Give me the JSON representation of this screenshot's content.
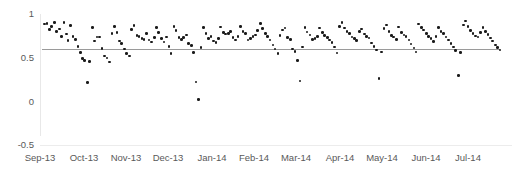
{
  "chart_data": {
    "type": "scatter",
    "title": "",
    "xlabel": "",
    "ylabel": "",
    "ylim": [
      -0.5,
      1
    ],
    "xlim": [
      "Sep-13",
      "Aug-14"
    ],
    "grid": false,
    "legend": null,
    "y_ticks": [
      "1",
      "0.5",
      "0",
      "-0.5"
    ],
    "y_tick_values": [
      1,
      0.5,
      0,
      -0.5
    ],
    "x_ticks": [
      "Sep-13",
      "Oct-13",
      "Nov-13",
      "Dec-13",
      "Jan-14",
      "Feb-14",
      "Mar-14",
      "Apr-14",
      "May-14",
      "Jun-14",
      "Jul-14"
    ],
    "reference_line": {
      "y": 0.6,
      "color": "#9a9a9a",
      "label": ""
    },
    "marker_color": "#1a1a1a",
    "series": [
      {
        "name": "series-1",
        "points": [
          [
            0.005,
            0.885
          ],
          [
            0.011,
            0.888
          ],
          [
            0.016,
            0.824
          ],
          [
            0.021,
            0.86
          ],
          [
            0.027,
            0.905
          ],
          [
            0.032,
            0.798
          ],
          [
            0.038,
            0.83
          ],
          [
            0.043,
            0.742
          ],
          [
            0.048,
            0.9
          ],
          [
            0.054,
            0.77
          ],
          [
            0.057,
            0.695
          ],
          [
            0.062,
            0.865
          ],
          [
            0.068,
            0.74
          ],
          [
            0.073,
            0.708
          ],
          [
            0.079,
            0.63
          ],
          [
            0.084,
            0.56
          ],
          [
            0.088,
            0.49
          ],
          [
            0.093,
            0.47
          ],
          [
            0.099,
            0.215
          ],
          [
            0.104,
            0.455
          ],
          [
            0.11,
            0.845
          ],
          [
            0.115,
            0.69
          ],
          [
            0.12,
            0.735
          ],
          [
            0.126,
            0.735
          ],
          [
            0.131,
            0.605
          ],
          [
            0.137,
            0.52
          ],
          [
            0.142,
            0.495
          ],
          [
            0.147,
            0.45
          ],
          [
            0.153,
            0.78
          ],
          [
            0.158,
            0.855
          ],
          [
            0.164,
            0.79
          ],
          [
            0.169,
            0.69
          ],
          [
            0.174,
            0.66
          ],
          [
            0.18,
            0.6
          ],
          [
            0.185,
            0.545
          ],
          [
            0.191,
            0.52
          ],
          [
            0.196,
            0.82
          ],
          [
            0.201,
            0.865
          ],
          [
            0.207,
            0.755
          ],
          [
            0.212,
            0.74
          ],
          [
            0.218,
            0.72
          ],
          [
            0.223,
            0.705
          ],
          [
            0.228,
            0.775
          ],
          [
            0.234,
            0.7
          ],
          [
            0.239,
            0.68
          ],
          [
            0.245,
            0.73
          ],
          [
            0.25,
            0.845
          ],
          [
            0.255,
            0.79
          ],
          [
            0.261,
            0.72
          ],
          [
            0.266,
            0.68
          ],
          [
            0.272,
            0.735
          ],
          [
            0.277,
            0.63
          ],
          [
            0.282,
            0.545
          ],
          [
            0.288,
            0.86
          ],
          [
            0.293,
            0.81
          ],
          [
            0.299,
            0.73
          ],
          [
            0.304,
            0.705
          ],
          [
            0.309,
            0.73
          ],
          [
            0.315,
            0.76
          ],
          [
            0.32,
            0.665
          ],
          [
            0.326,
            0.64
          ],
          [
            0.331,
            0.56
          ],
          [
            0.336,
            0.22
          ],
          [
            0.342,
            0.02
          ],
          [
            0.347,
            0.615
          ],
          [
            0.353,
            0.845
          ],
          [
            0.358,
            0.78
          ],
          [
            0.363,
            0.72
          ],
          [
            0.369,
            0.74
          ],
          [
            0.374,
            0.69
          ],
          [
            0.38,
            0.675
          ],
          [
            0.385,
            0.72
          ],
          [
            0.39,
            0.85
          ],
          [
            0.396,
            0.79
          ],
          [
            0.401,
            0.77
          ],
          [
            0.407,
            0.78
          ],
          [
            0.412,
            0.8
          ],
          [
            0.417,
            0.73
          ],
          [
            0.423,
            0.7
          ],
          [
            0.428,
            0.745
          ],
          [
            0.434,
            0.855
          ],
          [
            0.439,
            0.8
          ],
          [
            0.444,
            0.775
          ],
          [
            0.45,
            0.7
          ],
          [
            0.455,
            0.72
          ],
          [
            0.461,
            0.745
          ],
          [
            0.466,
            0.76
          ],
          [
            0.471,
            0.81
          ],
          [
            0.477,
            0.89
          ],
          [
            0.482,
            0.835
          ],
          [
            0.488,
            0.78
          ],
          [
            0.493,
            0.74
          ],
          [
            0.498,
            0.7
          ],
          [
            0.504,
            0.645
          ],
          [
            0.509,
            0.6
          ],
          [
            0.515,
            0.545
          ],
          [
            0.52,
            0.755
          ],
          [
            0.525,
            0.815
          ],
          [
            0.531,
            0.84
          ],
          [
            0.536,
            0.73
          ],
          [
            0.542,
            0.705
          ],
          [
            0.547,
            0.6
          ],
          [
            0.552,
            0.57
          ],
          [
            0.558,
            0.47
          ],
          [
            0.563,
            0.235
          ],
          [
            0.569,
            0.62
          ],
          [
            0.574,
            0.845
          ],
          [
            0.579,
            0.795
          ],
          [
            0.585,
            0.76
          ],
          [
            0.59,
            0.705
          ],
          [
            0.596,
            0.72
          ],
          [
            0.601,
            0.745
          ],
          [
            0.606,
            0.84
          ],
          [
            0.612,
            0.79
          ],
          [
            0.617,
            0.755
          ],
          [
            0.623,
            0.73
          ],
          [
            0.628,
            0.7
          ],
          [
            0.633,
            0.675
          ],
          [
            0.639,
            0.62
          ],
          [
            0.644,
            0.555
          ],
          [
            0.65,
            0.86
          ],
          [
            0.655,
            0.9
          ],
          [
            0.66,
            0.84
          ],
          [
            0.666,
            0.8
          ],
          [
            0.671,
            0.775
          ],
          [
            0.677,
            0.735
          ],
          [
            0.682,
            0.72
          ],
          [
            0.687,
            0.695
          ],
          [
            0.693,
            0.8
          ],
          [
            0.698,
            0.83
          ],
          [
            0.704,
            0.77
          ],
          [
            0.709,
            0.74
          ],
          [
            0.714,
            0.725
          ],
          [
            0.72,
            0.67
          ],
          [
            0.725,
            0.63
          ],
          [
            0.731,
            0.59
          ],
          [
            0.736,
            0.26
          ],
          [
            0.741,
            0.565
          ],
          [
            0.747,
            0.835
          ],
          [
            0.752,
            0.875
          ],
          [
            0.758,
            0.8
          ],
          [
            0.763,
            0.755
          ],
          [
            0.768,
            0.735
          ],
          [
            0.774,
            0.71
          ],
          [
            0.779,
            0.85
          ],
          [
            0.785,
            0.79
          ],
          [
            0.79,
            0.76
          ],
          [
            0.795,
            0.74
          ],
          [
            0.801,
            0.7
          ],
          [
            0.806,
            0.655
          ],
          [
            0.812,
            0.61
          ],
          [
            0.817,
            0.565
          ],
          [
            0.822,
            0.885
          ],
          [
            0.828,
            0.845
          ],
          [
            0.833,
            0.815
          ],
          [
            0.839,
            0.775
          ],
          [
            0.844,
            0.745
          ],
          [
            0.849,
            0.72
          ],
          [
            0.855,
            0.685
          ],
          [
            0.86,
            0.745
          ],
          [
            0.866,
            0.845
          ],
          [
            0.871,
            0.8
          ],
          [
            0.876,
            0.775
          ],
          [
            0.882,
            0.735
          ],
          [
            0.887,
            0.7
          ],
          [
            0.893,
            0.665
          ],
          [
            0.898,
            0.62
          ],
          [
            0.903,
            0.58
          ],
          [
            0.909,
            0.295
          ],
          [
            0.914,
            0.56
          ],
          [
            0.92,
            0.875
          ],
          [
            0.925,
            0.92
          ],
          [
            0.93,
            0.855
          ],
          [
            0.936,
            0.81
          ],
          [
            0.941,
            0.78
          ],
          [
            0.947,
            0.75
          ],
          [
            0.952,
            0.735
          ],
          [
            0.957,
            0.79
          ],
          [
            0.963,
            0.845
          ],
          [
            0.968,
            0.8
          ],
          [
            0.974,
            0.765
          ],
          [
            0.979,
            0.725
          ],
          [
            0.984,
            0.69
          ],
          [
            0.99,
            0.645
          ],
          [
            0.995,
            0.615
          ],
          [
            1.0,
            0.59
          ]
        ]
      }
    ]
  }
}
